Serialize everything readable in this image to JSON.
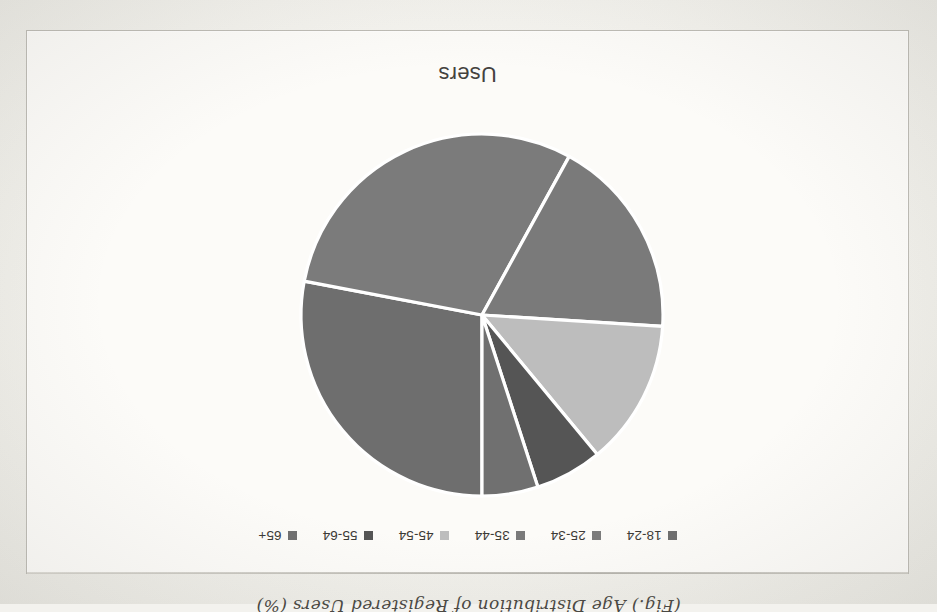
{
  "caption": {
    "text": "(Fig.) Age Distribution of Registered Users (%)"
  },
  "chart": {
    "title": "Users",
    "background": "#fcfbf8",
    "border_color": "#bdbbb4",
    "slice_divider_color": "#ffffff",
    "orientation_note": "image captured upside-down (rotated 180 degrees)"
  },
  "legend": {
    "position": "top",
    "items": [
      {
        "label": "18-24",
        "color": "#6e6e6e"
      },
      {
        "label": "25-34",
        "color": "#7b7b7b"
      },
      {
        "label": "35-44",
        "color": "#7a7a7a"
      },
      {
        "label": "45-54",
        "color": "#bdbdbd"
      },
      {
        "label": "55-64",
        "color": "#555555"
      },
      {
        "label": "65+",
        "color": "#707070"
      }
    ]
  },
  "chart_data": {
    "type": "pie",
    "title": "Users",
    "xlabel": "",
    "ylabel": "",
    "legend_position": "top",
    "grid": false,
    "categories": [
      "18-24",
      "25-34",
      "35-44",
      "45-54",
      "55-64",
      "65+"
    ],
    "values": [
      28,
      30,
      18,
      13,
      6,
      5
    ],
    "units": "percent",
    "colors": [
      "#6e6e6e",
      "#7b7b7b",
      "#7a7a7a",
      "#bdbdbd",
      "#555555",
      "#707070"
    ],
    "start_angle_deg": -90,
    "direction": "clockwise",
    "series": [
      {
        "name": "Users",
        "values": [
          28,
          30,
          18,
          13,
          6,
          5
        ]
      }
    ]
  }
}
